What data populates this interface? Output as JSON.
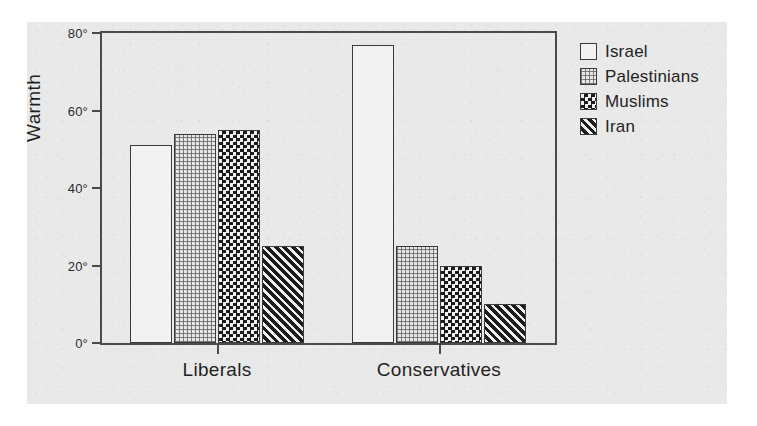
{
  "chart_data": {
    "type": "bar",
    "title": "",
    "xlabel": "",
    "ylabel": "Warmth",
    "ylim": [
      0,
      80
    ],
    "yticks": [
      0,
      20,
      40,
      60,
      80
    ],
    "ytick_labels": [
      "0°",
      "20°",
      "40°",
      "60°",
      "80°"
    ],
    "grid": false,
    "legend_position": "right",
    "categories": [
      "Liberals",
      "Conservatives"
    ],
    "series": [
      {
        "name": "Israel",
        "pattern": "solid-white",
        "values": [
          51,
          77
        ]
      },
      {
        "name": "Palestinians",
        "pattern": "dots",
        "values": [
          54,
          25
        ]
      },
      {
        "name": "Muslims",
        "pattern": "check",
        "values": [
          55,
          20
        ]
      },
      {
        "name": "Iran",
        "pattern": "hatch",
        "values": [
          25,
          10
        ]
      }
    ]
  },
  "legend": {
    "items": [
      {
        "label": "Israel"
      },
      {
        "label": "Palestinians"
      },
      {
        "label": "Muslims"
      },
      {
        "label": "Iran"
      }
    ]
  },
  "axes": {
    "y_title": "Warmth",
    "y_labels": [
      "80°",
      "60°",
      "40°",
      "20°",
      "0°"
    ],
    "x_labels": [
      "Liberals",
      "Conservatives"
    ]
  },
  "colors": {
    "panel_background": "#e9e9e9",
    "frame_line": "#4a4a4a",
    "bar_outline": "#3a3a3a",
    "bar_white_fill": "#f2f2f2",
    "bar_dark_fill": "#1c1c1c",
    "text": "#1f1f1f"
  }
}
